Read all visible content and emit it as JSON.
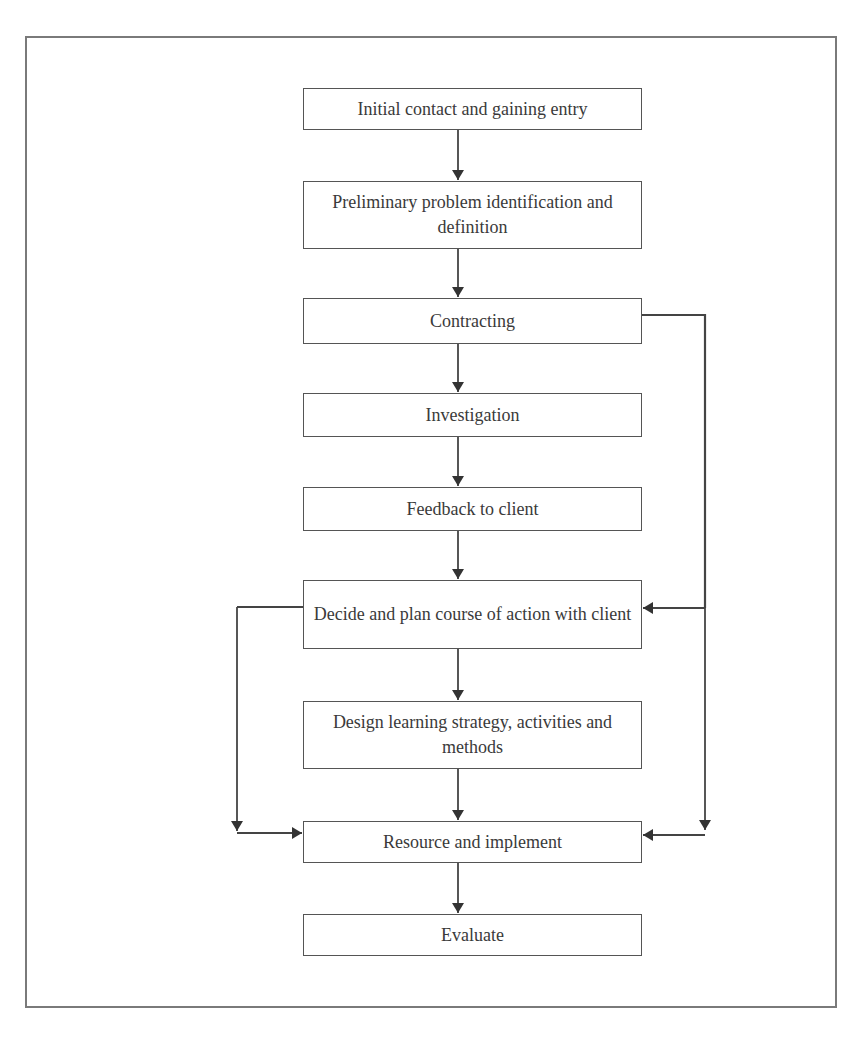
{
  "diagram": {
    "type": "flowchart",
    "nodes": [
      {
        "id": "initial",
        "label": "Initial contact and gaining entry"
      },
      {
        "id": "preliminary",
        "label": "Preliminary problem identification and definition"
      },
      {
        "id": "contracting",
        "label": "Contracting"
      },
      {
        "id": "investigation",
        "label": "Investigation"
      },
      {
        "id": "feedback",
        "label": "Feedback to client"
      },
      {
        "id": "decide",
        "label": "Decide and plan course of action with client"
      },
      {
        "id": "design",
        "label": "Design learning strategy, activities and methods"
      },
      {
        "id": "resource",
        "label": "Resource and implement"
      },
      {
        "id": "evaluate",
        "label": "Evaluate"
      }
    ],
    "edges": [
      {
        "from": "initial",
        "to": "preliminary"
      },
      {
        "from": "preliminary",
        "to": "contracting"
      },
      {
        "from": "contracting",
        "to": "investigation"
      },
      {
        "from": "investigation",
        "to": "feedback"
      },
      {
        "from": "feedback",
        "to": "decide"
      },
      {
        "from": "decide",
        "to": "design"
      },
      {
        "from": "design",
        "to": "resource"
      },
      {
        "from": "resource",
        "to": "evaluate"
      },
      {
        "from": "contracting",
        "to": "decide",
        "route": "right-side"
      },
      {
        "from": "contracting",
        "to": "resource",
        "route": "right-side"
      },
      {
        "from": "decide",
        "to": "resource",
        "route": "left-side"
      }
    ],
    "colors": {
      "line": "#444444",
      "frame": "#7a7a7a",
      "text": "#3a3a3a",
      "background": "#ffffff"
    }
  }
}
